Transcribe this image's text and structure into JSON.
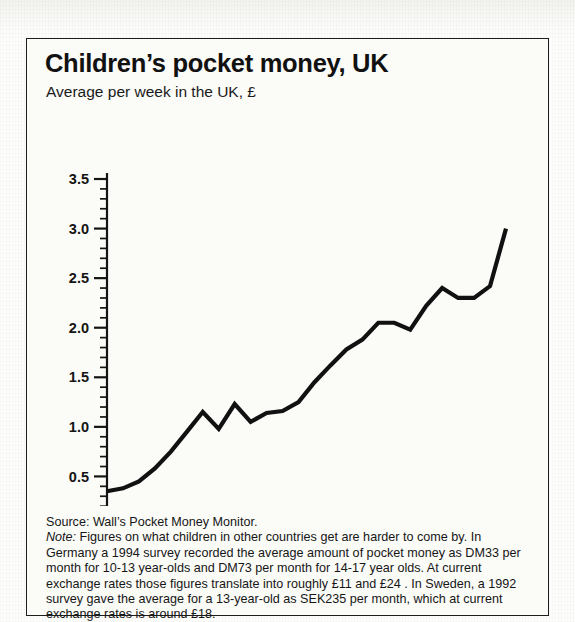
{
  "figure": {
    "title": "Children’s pocket money, UK",
    "subtitle": "Average per week in the UK, £",
    "source_label": "Source: Wall’s Pocket Money Monitor.",
    "note_label": "Note:",
    "note_text": " Figures on what children in other countries get are harder to come by.  In Germany a 1994 survey recorded the average amount of pocket money as DM33 per month for 10-13 year-olds and DM73 per month for 14-17 year olds. At current exchange rates those figures translate into roughly  £11 and  £24 . In Sweden, a 1992 survey gave the average for a 13-year-old as SEK235 per month, which at current exchange rates is around £18."
  },
  "colors": {
    "line": "#111111",
    "axis": "#141414",
    "paper": "#fbfbf8",
    "border": "#1d1d1d",
    "text": "#141414"
  },
  "chart_data": {
    "type": "line",
    "title": "Children’s pocket money, UK",
    "subtitle": "Average per week in the UK, £",
    "xlabel": "",
    "ylabel": "",
    "xlim": [
      1975,
      2000
    ],
    "ylim": [
      0.0,
      3.5
    ],
    "grid": false,
    "legend": "none",
    "y_ticks": [
      "0.0",
      "0.5",
      "1.0",
      "1.5",
      "2.0",
      "2.5",
      "3.0",
      "3.5"
    ],
    "y_tick_values": [
      0.0,
      0.5,
      1.0,
      1.5,
      2.0,
      2.5,
      3.0,
      3.5
    ],
    "y_minor_tick_step": 0.1,
    "x_ticks": [
      "1975",
      "1980",
      "1985",
      "1990",
      "1995",
      "2000"
    ],
    "x_tick_values": [
      1975,
      1980,
      1985,
      1990,
      1995,
      2000
    ],
    "series": [
      {
        "name": "Average pocket money per week (£)",
        "x": [
          1975,
          1976,
          1977,
          1978,
          1979,
          1980,
          1981,
          1982,
          1983,
          1984,
          1985,
          1986,
          1987,
          1988,
          1989,
          1990,
          1991,
          1992,
          1993,
          1994,
          1995,
          1996,
          1997,
          1998,
          1999,
          2000
        ],
        "values": [
          0.35,
          0.38,
          0.45,
          0.58,
          0.75,
          0.95,
          1.15,
          0.98,
          1.23,
          1.05,
          1.14,
          1.16,
          1.25,
          1.45,
          1.62,
          1.78,
          1.88,
          2.05,
          2.05,
          1.98,
          2.22,
          2.4,
          2.3,
          2.3,
          2.42,
          3.0
        ]
      }
    ]
  }
}
